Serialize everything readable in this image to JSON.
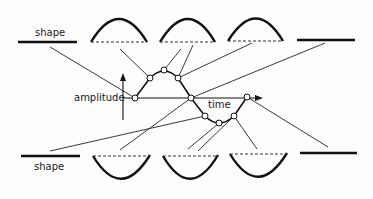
{
  "labels": {
    "top_shape": "shape",
    "bottom_shape": "shape",
    "amplitude": "amplitude",
    "time": "time"
  },
  "colors": {
    "ink": "#111111",
    "background": "#fdfdfd"
  }
}
